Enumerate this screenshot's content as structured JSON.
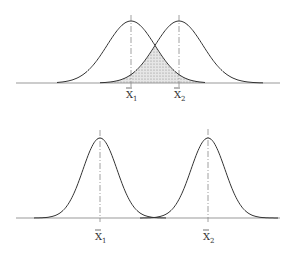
{
  "panels": [
    {
      "name": "overlapping-distributions",
      "means": [
        {
          "label": "X",
          "subscript": "1"
        },
        {
          "label": "X",
          "subscript": "2"
        }
      ],
      "overlap_shaded": true
    },
    {
      "name": "separated-distributions",
      "means": [
        {
          "label": "X",
          "subscript": "1"
        },
        {
          "label": "X",
          "subscript": "2"
        }
      ],
      "overlap_shaded": false
    }
  ],
  "colors": {
    "line": "#333333",
    "axis": "#999999",
    "shade": "#cccccc"
  }
}
